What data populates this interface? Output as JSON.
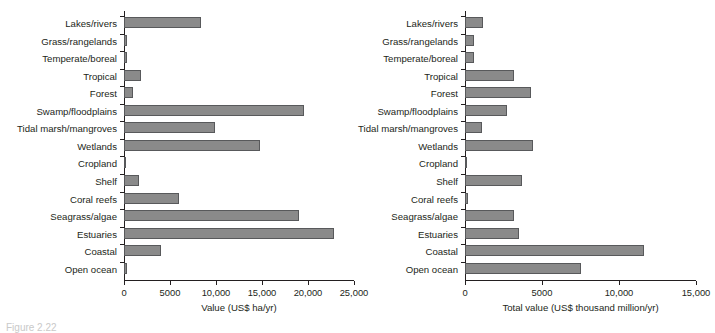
{
  "figure": {
    "caption": "Figure 2.22"
  },
  "chart_data": [
    {
      "type": "bar",
      "orientation": "horizontal",
      "panel": "left",
      "title": "",
      "xlabel": "Value (US$ ha/yr)",
      "ylabel": "",
      "xlim": [
        0,
        25000
      ],
      "xticks": [
        0,
        5000,
        10000,
        15000,
        20000,
        25000
      ],
      "xticklabels": [
        "0",
        "5000",
        "10,000",
        "15,000",
        "20,000",
        "25,000"
      ],
      "grid": false,
      "legend": false,
      "bar_color": "#8a8a8a",
      "bar_edge_color": "#58595b",
      "categories": [
        "Lakes/rivers",
        "Grass/rangelands",
        "Temperate/boreal",
        "Tropical",
        "Forest",
        "Swamp/floodplains",
        "Tidal marsh/mangroves",
        "Wetlands",
        "Cropland",
        "Shelf",
        "Coral reefs",
        "Seagrass/algae",
        "Estuaries",
        "Coastal",
        "Open ocean"
      ],
      "values": [
        8400,
        280,
        300,
        1900,
        1000,
        19600,
        9900,
        14800,
        100,
        1600,
        6000,
        19000,
        22800,
        4000,
        300
      ]
    },
    {
      "type": "bar",
      "orientation": "horizontal",
      "panel": "right",
      "title": "",
      "xlabel": "Total value (US$ thousand million/yr)",
      "ylabel": "",
      "xlim": [
        0,
        15000
      ],
      "xticks": [
        0,
        5000,
        10000,
        15000
      ],
      "xticklabels": [
        "0",
        "5000",
        "10,000",
        "15,000"
      ],
      "grid": false,
      "legend": false,
      "bar_color": "#8a8a8a",
      "bar_edge_color": "#58595b",
      "categories": [
        "Lakes/rivers",
        "Grass/rangelands",
        "Temperate/boreal",
        "Tropical",
        "Forest",
        "Swamp/floodplains",
        "Tidal marsh/mangroves",
        "Wetlands",
        "Cropland",
        "Shelf",
        "Coral reefs",
        "Seagrass/algae",
        "Estuaries",
        "Coastal",
        "Open ocean"
      ],
      "values": [
        1200,
        600,
        600,
        3200,
        4300,
        2700,
        1100,
        4400,
        50,
        3700,
        180,
        3150,
        3500,
        11600,
        7500
      ]
    }
  ]
}
